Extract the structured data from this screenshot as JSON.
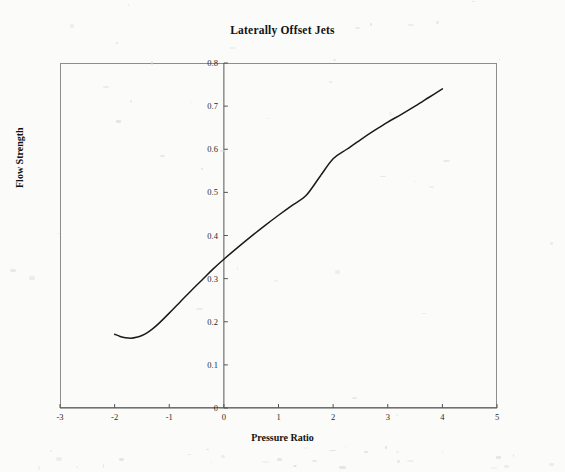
{
  "chart_data": {
    "type": "line",
    "title": "Laterally Offset Jets",
    "xlabel": "Pressure Ratio",
    "ylabel": "Flow Strength",
    "xlim": [
      -3,
      5
    ],
    "ylim": [
      0,
      0.8
    ],
    "grid": false,
    "legend": null,
    "xticks": [
      "-3",
      "-2",
      "-1",
      "0",
      "1",
      "2",
      "3",
      "4",
      "5"
    ],
    "xtick_values": [
      -3,
      -2,
      -1,
      0,
      1,
      2,
      3,
      4,
      5
    ],
    "yticks": [
      "0",
      "0.1",
      "0.2",
      "0.3",
      "0.4",
      "0.5",
      "0.6",
      "0.7",
      "0.8"
    ],
    "ytick_values": [
      0,
      0.1,
      0.2,
      0.3,
      0.4,
      0.5,
      0.6,
      0.7,
      0.8
    ],
    "y_axis_position": 0,
    "series": [
      {
        "name": "Flow Strength",
        "color": "#1a1a1a",
        "x": [
          -2.0,
          -1.9,
          -1.8,
          -1.7,
          -1.6,
          -1.5,
          -1.4,
          -1.3,
          -1.2,
          -1.0,
          -0.8,
          -0.6,
          -0.4,
          -0.2,
          0.0,
          0.25,
          0.5,
          0.75,
          1.0,
          1.25,
          1.5,
          1.75,
          2.0,
          2.25,
          2.5,
          2.75,
          3.0,
          3.25,
          3.5,
          3.75,
          4.0
        ],
        "y": [
          0.171,
          0.166,
          0.163,
          0.162,
          0.164,
          0.168,
          0.175,
          0.184,
          0.195,
          0.22,
          0.246,
          0.272,
          0.297,
          0.322,
          0.345,
          0.372,
          0.398,
          0.423,
          0.447,
          0.47,
          0.492,
          0.535,
          0.578,
          0.6,
          0.622,
          0.643,
          0.663,
          0.681,
          0.7,
          0.72,
          0.74
        ]
      }
    ]
  }
}
